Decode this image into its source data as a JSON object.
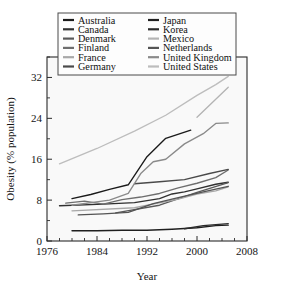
{
  "chart_data": {
    "type": "line",
    "title": "",
    "xlabel": "Year",
    "ylabel": "Obesity (% population)",
    "xlim": [
      1976,
      2008
    ],
    "ylim": [
      0,
      36
    ],
    "xticks": [
      1976,
      1984,
      1992,
      2000,
      2008
    ],
    "xticklabels": [
      "1976",
      "1984",
      "1992",
      "2000",
      "2008"
    ],
    "xminorticks": [
      1978,
      1980,
      1982,
      1986,
      1988,
      1990,
      1994,
      1996,
      1998,
      2002,
      2004,
      2006
    ],
    "yticks": [
      0,
      8,
      16,
      24,
      32
    ],
    "yticklabels": [
      "0",
      "8",
      "16",
      "24",
      "32"
    ],
    "yminorticks": [
      4,
      12,
      20,
      28,
      36
    ],
    "grid": false,
    "legend_position": "top-center",
    "series": [
      {
        "name": "Australia",
        "color": "#1a1a1a",
        "x": [
          1980,
          1983,
          1986,
          1989,
          1992,
          1995,
          1999
        ],
        "values": [
          8.3,
          9.1,
          10.1,
          11.0,
          16.5,
          20.1,
          21.7
        ]
      },
      {
        "name": "Canada",
        "color": "#303030",
        "x": [
          1978,
          1985,
          1990,
          1994,
          1996,
          1998,
          2000,
          2003,
          2005
        ],
        "values": [
          6.9,
          7.2,
          7.5,
          8.3,
          9.2,
          9.6,
          10.2,
          11.1,
          11.5
        ]
      },
      {
        "name": "Denmark",
        "color": "#595959",
        "x": [
          1987,
          1994,
          2000,
          2005
        ],
        "values": [
          5.5,
          7.0,
          9.5,
          11.4
        ]
      },
      {
        "name": "Finland",
        "color": "#6e6e6e",
        "x": [
          1979,
          1982,
          1985,
          1988,
          1991,
          1994,
          1997,
          2000,
          2003,
          2005
        ],
        "values": [
          7.4,
          7.8,
          7.2,
          8.1,
          8.6,
          9.3,
          10.4,
          11.3,
          12.4,
          13.9
        ]
      },
      {
        "name": "France",
        "color": "#a8a8a8",
        "x": [
          1980,
          1990,
          1997,
          2000,
          2003,
          2005
        ],
        "values": [
          5.9,
          6.5,
          8.2,
          9.2,
          9.8,
          10.6
        ]
      },
      {
        "name": "Germany",
        "color": "#4a4a4a",
        "x": [
          1990,
          1994,
          1998,
          2002,
          2005
        ],
        "values": [
          11.2,
          11.6,
          12.0,
          13.2,
          14.0
        ]
      },
      {
        "name": "Japan",
        "color": "#1f1f1f",
        "x": [
          1980,
          1984,
          1988,
          1992,
          1996,
          2000,
          2003,
          2005
        ],
        "values": [
          2.0,
          2.0,
          2.1,
          2.1,
          2.3,
          2.6,
          3.0,
          3.1
        ]
      },
      {
        "name": "Korea",
        "color": "#2b2b2b",
        "x": [
          1998,
          2001,
          2005
        ],
        "values": [
          2.4,
          3.0,
          3.4
        ]
      },
      {
        "name": "Mexico",
        "color": "#b4b4b4",
        "x": [
          2000,
          2005
        ],
        "values": [
          24.2,
          30.1
        ]
      },
      {
        "name": "Netherlands",
        "color": "#545454",
        "x": [
          1981,
          1985,
          1989,
          1993,
          1997,
          2001,
          2005
        ],
        "values": [
          5.1,
          5.3,
          5.6,
          7.3,
          8.5,
          9.6,
          10.7
        ]
      },
      {
        "name": "United Kingdom",
        "color": "#8a8a8a",
        "x": [
          1980,
          1986,
          1989,
          1991,
          1993,
          1995,
          1998,
          2001,
          2003,
          2005
        ],
        "values": [
          7.0,
          8.0,
          9.3,
          13.2,
          15.5,
          16.0,
          19.0,
          21.0,
          23.0,
          23.1
        ]
      },
      {
        "name": "United States",
        "color": "#bdbdbd",
        "x": [
          1978,
          1984,
          1990,
          1995,
          2000,
          2003,
          2005
        ],
        "values": [
          15.1,
          18.1,
          21.5,
          24.6,
          28.5,
          30.6,
          32.2
        ]
      }
    ]
  },
  "legend": {
    "column_left": [
      "Australia",
      "Canada",
      "Denmark",
      "Finland",
      "France",
      "Germany"
    ],
    "column_right": [
      "Japan",
      "Korea",
      "Mexico",
      "Netherlands",
      "United Kingdom",
      "United States"
    ]
  }
}
